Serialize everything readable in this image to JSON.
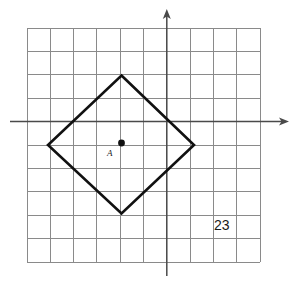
{
  "figure": {
    "kind": "coordinate-grid-geometry-figure",
    "problem_number": "23",
    "background_color": "#ffffff",
    "grid": {
      "columns": 10,
      "rows": 10,
      "left": 27,
      "top": 28,
      "cell_width": 23.3,
      "cell_height": 23.4,
      "line_color": "#8a8a8a",
      "line_width": 1,
      "border_color": "#9a9a9a"
    },
    "axes": {
      "color": "#4a4a4a",
      "line_width": 1.4,
      "x_axis": {
        "name": "x-axis",
        "y": 122,
        "x_start": 10,
        "x_end": 288,
        "arrow_at": "right"
      },
      "y_axis": {
        "name": "y-axis",
        "x": 169,
        "y_start": 275,
        "y_end": 10,
        "arrow_at": "top"
      },
      "origin": {
        "x": 169,
        "y": 122
      }
    },
    "shape": {
      "name": "square-rotated-diamond",
      "type": "square",
      "stroke_color": "#111111",
      "stroke_width": 2.6,
      "fill": "none",
      "vertices": [
        {
          "label": "top",
          "x": 122,
          "y": 76
        },
        {
          "label": "right",
          "x": 194,
          "y": 145
        },
        {
          "label": "bottom",
          "x": 122,
          "y": 213
        },
        {
          "label": "left",
          "x": 48,
          "y": 145
        }
      ],
      "vertices_in_grid_units": [
        {
          "label": "top",
          "x": -2,
          "y": 2
        },
        {
          "label": "right",
          "x": 1,
          "y": -1
        },
        {
          "label": "bottom",
          "x": -2,
          "y": -4
        },
        {
          "label": "left",
          "x": -5,
          "y": -1
        }
      ]
    },
    "marked_point": {
      "name": "point-A",
      "label": "A",
      "x": 122,
      "y": 143,
      "radius": 3.4,
      "color": "#111111"
    }
  }
}
